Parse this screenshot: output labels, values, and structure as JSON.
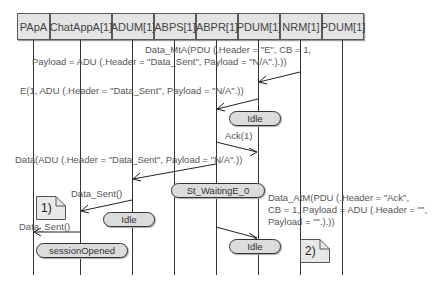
{
  "lifelines": [
    {
      "name": "PApA"
    },
    {
      "name": "ChatAppA[1]"
    },
    {
      "name": "ADUM[1]"
    },
    {
      "name": "ABPS[1]"
    },
    {
      "name": "ABPR[1]"
    },
    {
      "name": "PDUM[1]"
    },
    {
      "name": "NRM[1]"
    },
    {
      "name": "PDUM[1]"
    }
  ],
  "messages": [
    {
      "line1": "Data_MtA(PDU (.Header = \"E\", CB = 1,",
      "line2": "Payload = ADU (.Header = \"Data_Sent\", Payload = \"N/A\".).))",
      "from": "NRM[1]",
      "to": "PDUM[1]"
    },
    {
      "label": "E(1, ADU (.Header = \"Data_Sent\", Payload = \"N/A\".))",
      "from": "PDUM[1]",
      "to": "ABPR[1]"
    },
    {
      "label": "Ack(1)",
      "from": "ABPR[1]",
      "to": "PDUM[1]"
    },
    {
      "label": "Data(ADU (.Header = \"Data_Sent\", Payload = \"N/A\".))",
      "from": "ABPR[1]",
      "to": "ADUM[1]"
    },
    {
      "label": "Data_Sent()",
      "from": "ADUM[1]",
      "to": "ChatAppA[1]"
    },
    {
      "label": "Data_Sent()",
      "from": "ChatAppA[1]",
      "to": "PApA"
    },
    {
      "line1": "Data_AtM(PDU (.Header = \"Ack\",",
      "line2": "CB = 1, Payload = ADU (.Header = \"\",",
      "line3": "Payload = \"\".).))",
      "from": "ABPR[1]",
      "to": "PDUM[1]"
    }
  ],
  "states": {
    "idle_pdum_1": "Idle",
    "waiting": "St_WaitingE_0",
    "idle_adum": "Idle",
    "session": "sessionOpened",
    "idle_abpr": "Idle"
  },
  "notes": {
    "note1": "1)",
    "note2": "2)"
  }
}
